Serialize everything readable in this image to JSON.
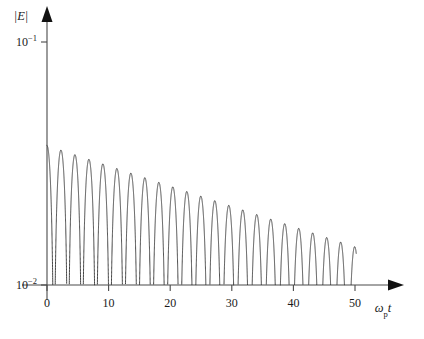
{
  "figure": {
    "background_color": "#ffffff",
    "curve_color": "#3a3a3a",
    "axis_color": "#4a4a4a"
  },
  "labels": {
    "y_axis_title_main": "|E|",
    "x_axis_title_omega": "ω",
    "x_axis_title_sub": "p",
    "x_axis_title_t": "t",
    "y_tick_mantissa": "10",
    "y_tick_exp_upper": "−1",
    "y_tick_exp_lower": "−2"
  },
  "chart_data": {
    "type": "line",
    "title": "",
    "subtitle": "",
    "xlabel": "ωₚ t",
    "ylabel": "|E|",
    "xlim": [
      -1.5,
      56
    ],
    "ylim": [
      0.01,
      0.18
    ],
    "yscale": "log",
    "xscale": "linear",
    "grid": false,
    "legend": null,
    "x_ticks": [
      0,
      10,
      20,
      30,
      40,
      50
    ],
    "x_tick_labels": [
      "0",
      "10",
      "20",
      "30",
      "40",
      "50"
    ],
    "y_ticks": [
      0.1,
      0.01
    ],
    "y_tick_labels": [
      "10⁻¹",
      "10⁻²"
    ],
    "model": {
      "form": "|E| = A0 * exp(-gamma * t) * |cos(omega * t + phi)|",
      "A0": 0.0375,
      "gamma": 0.0192,
      "omega": 1.3835,
      "phi": 0.0,
      "t_start": 0.0,
      "t_end": 50.2,
      "floor": 0.0098
    },
    "envelope": {
      "comment": "Upper envelope A0*exp(-gamma*t) sampled at the peak times",
      "t": [
        0.0,
        2.27,
        4.54,
        6.81,
        9.08,
        11.35,
        13.62,
        15.89,
        18.16,
        20.43,
        22.7,
        24.97,
        27.24,
        29.51,
        31.78,
        34.05,
        36.32,
        38.59,
        40.86,
        43.13,
        45.4,
        47.67,
        49.94
      ],
      "values": [
        0.0375,
        0.0359,
        0.0344,
        0.0329,
        0.0315,
        0.0302,
        0.0289,
        0.0277,
        0.0265,
        0.0254,
        0.0243,
        0.0233,
        0.0223,
        0.0213,
        0.0204,
        0.0196,
        0.0187,
        0.0179,
        0.0172,
        0.0164,
        0.0157,
        0.0151,
        0.0144
      ]
    },
    "peaks": {
      "comment": "Local maxima of |E| read off the figure; x in omega_p*t, y in |E|",
      "x": [
        0.0,
        2.27,
        4.54,
        6.81,
        9.08,
        11.35,
        13.62,
        15.89,
        18.16,
        20.43,
        22.7,
        24.97,
        27.24,
        29.51,
        31.78,
        34.05,
        36.32,
        38.59,
        40.86,
        43.13,
        45.4,
        47.67,
        49.94
      ],
      "y": [
        0.0375,
        0.0359,
        0.0344,
        0.0329,
        0.0315,
        0.0302,
        0.0289,
        0.0277,
        0.0265,
        0.0254,
        0.0243,
        0.0233,
        0.0223,
        0.0213,
        0.0204,
        0.0196,
        0.0187,
        0.0179,
        0.0172,
        0.0164,
        0.0157,
        0.0151,
        0.0144
      ]
    },
    "nulls": {
      "comment": "Times of the deep minima (zero crossings of the oscillating field)",
      "x": [
        1.135,
        3.405,
        5.675,
        7.945,
        10.215,
        12.485,
        14.755,
        17.025,
        19.295,
        21.565,
        23.835,
        26.105,
        28.375,
        30.645,
        32.915,
        35.185,
        37.455,
        39.725,
        41.995,
        44.265,
        46.535,
        48.805
      ]
    }
  }
}
